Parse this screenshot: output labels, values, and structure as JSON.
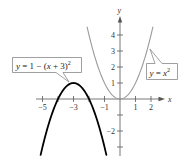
{
  "chart_data": {
    "type": "line",
    "title": "",
    "xlabel": "x",
    "ylabel": "y",
    "xlim": [
      -5.6,
      2.6
    ],
    "ylim": [
      -3.6,
      4.8
    ],
    "grid": false,
    "x_ticks": [
      -5,
      -4,
      -3,
      -2,
      -1,
      1,
      2
    ],
    "x_tick_labels": [
      {
        "value": -5,
        "label": "−5"
      },
      {
        "value": -3,
        "label": "−3"
      },
      {
        "value": -1,
        "label": "−1"
      },
      {
        "value": 1,
        "label": "1"
      },
      {
        "value": 2,
        "label": "2"
      }
    ],
    "y_ticks": [
      -3,
      -2,
      -1,
      1,
      2,
      3,
      4
    ],
    "y_tick_labels": [
      {
        "value": 4,
        "label": "4"
      },
      {
        "value": 3,
        "label": "3"
      },
      {
        "value": 2,
        "label": "2"
      },
      {
        "value": 1,
        "label": "1"
      },
      {
        "value": -2,
        "label": "−2"
      }
    ],
    "series": [
      {
        "name": "y = x^2",
        "label": "y = x²",
        "color": "#9a9a9a",
        "function": "x^2",
        "x_range": [
          -2.12,
          2.12
        ],
        "x": [
          -2.12,
          -2,
          -1.5,
          -1,
          -0.5,
          0,
          0.5,
          1,
          1.5,
          2,
          2.12
        ],
        "y": [
          4.5,
          4,
          2.25,
          1,
          0.25,
          0,
          0.25,
          1,
          2.25,
          4,
          4.5
        ]
      },
      {
        "name": "y = 1 - (x + 3)^2",
        "label": "y = 1 − (x + 3)²",
        "color": "#000000",
        "function": "1-(x+3)^2",
        "x_range": [
          -5.12,
          -0.88
        ],
        "x": [
          -5.12,
          -5,
          -4.5,
          -4,
          -3.5,
          -3,
          -2.5,
          -2,
          -1.5,
          -1,
          -0.88
        ],
        "y": [
          -3.5,
          -3,
          -1.25,
          0,
          0.75,
          1,
          0.75,
          0,
          -1.25,
          -3,
          -3.5
        ]
      }
    ],
    "annotations": [
      {
        "text": "y = 1 − (x + 3)²",
        "points_to": [
          -3,
          1
        ]
      },
      {
        "text": "y = x²",
        "points_to": [
          1.9,
          3.6
        ]
      }
    ]
  },
  "labels": {
    "x_axis": "x",
    "y_axis": "y",
    "parabola_gray": {
      "y": "y",
      "eq": " = ",
      "x": "x",
      "exp": "2"
    },
    "parabola_black": {
      "y": "y",
      "eq": " = 1 − (",
      "x": "x",
      "rest": " + 3)",
      "exp": "2"
    }
  },
  "colors": {
    "axis": "#555555",
    "gray_curve": "#9a9a9a",
    "black_curve": "#000000",
    "label_border": "#888888"
  }
}
